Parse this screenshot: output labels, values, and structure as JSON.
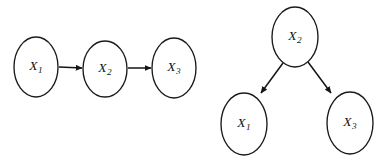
{
  "figure": {
    "background_color": "#ffffff",
    "stroke_color": "#1a1a1a",
    "text_color": "#111111",
    "width": 385,
    "height": 162
  },
  "diagrams": [
    {
      "id": "chain-graph",
      "name": "Markov chain X1 to X2 to X3",
      "layout": "horizontal-chain",
      "nodes": [
        {
          "id": "left-x1",
          "base": "X",
          "sub": "1",
          "cx": 36,
          "cy": 67,
          "rx": 22,
          "ry": 30
        },
        {
          "id": "left-x2",
          "base": "X",
          "sub": "2",
          "cx": 105,
          "cy": 69,
          "rx": 22,
          "ry": 28
        },
        {
          "id": "left-x3",
          "base": "X",
          "sub": "3",
          "cx": 174,
          "cy": 68,
          "rx": 22,
          "ry": 30
        }
      ],
      "edges": [
        {
          "id": "left-edge-1",
          "from": "left-x1",
          "to": "left-x2",
          "x1": 59,
          "y1": 67,
          "x2": 82,
          "y2": 68
        },
        {
          "id": "left-edge-2",
          "from": "left-x2",
          "to": "left-x3",
          "x1": 128,
          "y1": 68,
          "x2": 151,
          "y2": 68
        }
      ]
    },
    {
      "id": "fork-graph",
      "name": "Common cause X2 to X1 and X3",
      "layout": "fork",
      "nodes": [
        {
          "id": "right-x2",
          "base": "X",
          "sub": "2",
          "cx": 295,
          "cy": 37,
          "rx": 23,
          "ry": 30
        },
        {
          "id": "right-x1",
          "base": "X",
          "sub": "1",
          "cx": 244,
          "cy": 124,
          "rx": 23,
          "ry": 31
        },
        {
          "id": "right-x3",
          "base": "X",
          "sub": "3",
          "cx": 350,
          "cy": 123,
          "rx": 23,
          "ry": 31
        }
      ],
      "edges": [
        {
          "id": "right-edge-1",
          "from": "right-x2",
          "to": "right-x1",
          "x1": 283,
          "y1": 63,
          "x2": 261,
          "y2": 93
        },
        {
          "id": "right-edge-2",
          "from": "right-x2",
          "to": "right-x3",
          "x1": 308,
          "y1": 62,
          "x2": 331,
          "y2": 93
        }
      ]
    }
  ]
}
